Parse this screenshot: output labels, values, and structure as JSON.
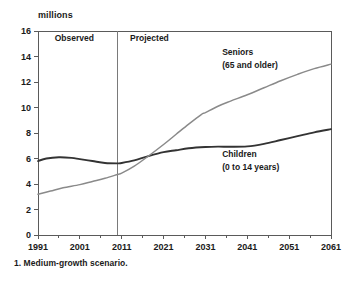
{
  "unit_label": "millions",
  "footnote": "1. Medium-growth scenario.",
  "regions": {
    "observed": "Observed",
    "projected": "Projected",
    "divider_year": 2010
  },
  "labels": {
    "seniors_line1": "Seniors",
    "seniors_line2": "(65 and older)",
    "children_line1": "Children",
    "children_line2": "(0 to 14 years)"
  },
  "colors": {
    "seniors": "#8a8a8a",
    "children": "#333333",
    "axis": "#5a5a5a",
    "divider": "#7a7a7a",
    "text": "#1a1a1a",
    "background": "#ffffff"
  },
  "chart_data": {
    "type": "line",
    "title": "",
    "subtitle": "",
    "xlabel": "",
    "ylabel": "millions",
    "xlim": [
      1991,
      2061
    ],
    "ylim": [
      0,
      16
    ],
    "yticks": [
      0,
      2,
      4,
      6,
      8,
      10,
      12,
      14,
      16
    ],
    "xticks": [
      1991,
      2001,
      2011,
      2021,
      2031,
      2041,
      2051,
      2061
    ],
    "x_minor_interval": 5,
    "grid": false,
    "legend_position": "inline-annotations",
    "annotations": [
      {
        "text": "Observed",
        "x": 1995,
        "y": 15.2
      },
      {
        "text": "Projected",
        "x": 2013,
        "y": 15.2
      },
      {
        "text": "Seniors",
        "x": 2035,
        "y": 14.1
      },
      {
        "text": "(65 and older)",
        "x": 2035,
        "y": 13.1
      },
      {
        "text": "Children",
        "x": 2035,
        "y": 6.1
      },
      {
        "text": "(0 to 14 years)",
        "x": 2035,
        "y": 5.1
      }
    ],
    "series": [
      {
        "name": "Children (0 to 14 years)",
        "color": "#333333",
        "x": [
          1991,
          1993,
          1996,
          1999,
          2001,
          2004,
          2007,
          2010,
          2011,
          2014,
          2017,
          2021,
          2024,
          2027,
          2031,
          2034,
          2037,
          2041,
          2045,
          2049,
          2053,
          2057,
          2061
        ],
        "values": [
          5.8,
          6.0,
          6.1,
          6.05,
          5.95,
          5.8,
          5.65,
          5.62,
          5.65,
          5.85,
          6.15,
          6.5,
          6.65,
          6.8,
          6.9,
          6.93,
          6.92,
          6.95,
          7.15,
          7.45,
          7.75,
          8.05,
          8.3
        ]
      },
      {
        "name": "Seniors (65 and older)",
        "color": "#8a8a8a",
        "x": [
          1991,
          1994,
          1997,
          2001,
          2004,
          2007,
          2010,
          2011,
          2014,
          2017,
          2021,
          2024,
          2027,
          2030,
          2031,
          2034,
          2037,
          2041,
          2045,
          2049,
          2053,
          2057,
          2061
        ],
        "values": [
          3.2,
          3.45,
          3.7,
          3.95,
          4.2,
          4.45,
          4.75,
          4.85,
          5.4,
          6.1,
          7.1,
          7.9,
          8.7,
          9.45,
          9.6,
          10.1,
          10.5,
          11.0,
          11.55,
          12.1,
          12.6,
          13.05,
          13.4
        ]
      }
    ]
  }
}
